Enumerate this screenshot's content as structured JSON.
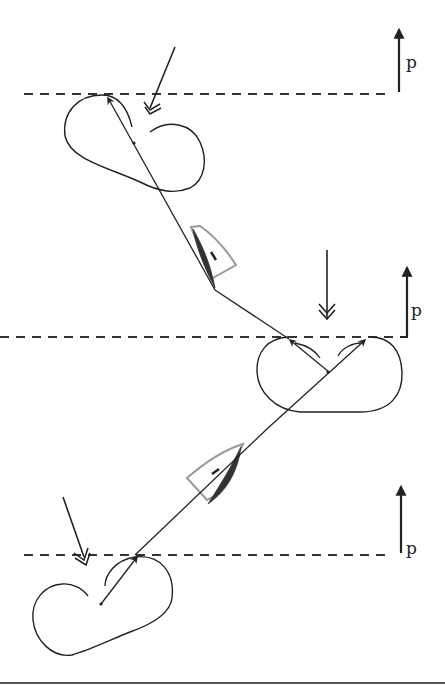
{
  "diagram": {
    "type": "sailing-course-penalty-turns",
    "labels": {
      "top_distance": "p",
      "middle_distance": "p",
      "bottom_distance": "p"
    },
    "colors": {
      "line": "#222222",
      "dashed_line": "#333333",
      "boat_outline": "#999999",
      "sail": "#333333",
      "background": "#ffffff"
    },
    "elements": [
      {
        "name": "dashed-line-top",
        "y": 94
      },
      {
        "name": "dashed-line-middle",
        "y": 337
      },
      {
        "name": "dashed-line-bottom",
        "y": 555
      },
      {
        "name": "loop-top"
      },
      {
        "name": "loop-middle"
      },
      {
        "name": "loop-bottom"
      },
      {
        "name": "boat-upper"
      },
      {
        "name": "boat-lower"
      },
      {
        "name": "wind-arrow-top"
      },
      {
        "name": "wind-arrow-middle"
      },
      {
        "name": "wind-arrow-bottom"
      }
    ]
  }
}
